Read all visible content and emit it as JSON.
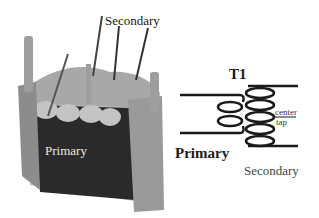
{
  "photo": {
    "labels": {
      "secondary": "Secondary",
      "primary": "Primary"
    }
  },
  "schematic": {
    "designator": "T1",
    "primary_label": "Primary",
    "secondary_label": "Secondary",
    "center_tap_label_line1": "center",
    "center_tap_label_line2": "tap",
    "primary_loops": 2,
    "secondary_loops": 5
  },
  "colors": {
    "wire": "#1a1a1a",
    "core_dark": "#2a2a2a",
    "frame": "#9a9a9a",
    "background": "#ffffff"
  }
}
